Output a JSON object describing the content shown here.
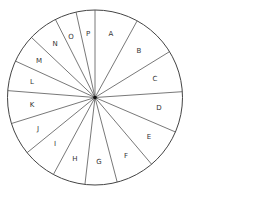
{
  "diagram": {
    "type": "segmented-circle",
    "center": [
      95,
      97.5
    ],
    "radius": 87.5,
    "stroke_color": "#444444",
    "spoke_color": "#555555",
    "label_color": "#333333",
    "spoke_angles_deg": [
      0,
      28.8,
      58.4,
      86.2,
      113.2,
      139.7,
      165.3,
      186.6,
      208.4,
      230.9,
      252.7,
      274.5,
      294.6,
      313.4,
      333.1,
      347.5
    ],
    "segments": [
      {
        "label": "A",
        "x": 111,
        "y": 34
      },
      {
        "label": "B",
        "x": 139,
        "y": 51
      },
      {
        "label": "C",
        "x": 155,
        "y": 79
      },
      {
        "label": "D",
        "x": 159,
        "y": 108
      },
      {
        "label": "E",
        "x": 149,
        "y": 137
      },
      {
        "label": "F",
        "x": 126,
        "y": 156
      },
      {
        "label": "G",
        "x": 99,
        "y": 162
      },
      {
        "label": "H",
        "x": 75,
        "y": 159
      },
      {
        "label": "I",
        "x": 55,
        "y": 144
      },
      {
        "label": "J",
        "x": 38,
        "y": 129
      },
      {
        "label": "K",
        "x": 32,
        "y": 105
      },
      {
        "label": "L",
        "x": 32,
        "y": 82
      },
      {
        "label": "M",
        "x": 39,
        "y": 61
      },
      {
        "label": "N",
        "x": 55,
        "y": 44
      },
      {
        "label": "O",
        "x": 71,
        "y": 37
      },
      {
        "label": "P",
        "x": 88,
        "y": 34
      }
    ]
  }
}
